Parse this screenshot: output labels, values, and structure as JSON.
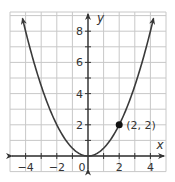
{
  "chart_data": {
    "type": "line",
    "title": "",
    "function": "y = x^2 / 2",
    "xlabel": "x",
    "ylabel": "y",
    "xlim": [
      -5,
      5
    ],
    "ylim": [
      -1,
      9
    ],
    "grid": true,
    "x_ticks": [
      -4,
      -2,
      0,
      2,
      4
    ],
    "x_tick_labels": [
      "−4",
      "−2",
      "0",
      "2",
      "4"
    ],
    "y_ticks": [
      2,
      4,
      6,
      8
    ],
    "y_tick_labels": [
      "2",
      "4",
      "6",
      "8"
    ],
    "series": [
      {
        "name": "parabola",
        "x": [
          -4.2,
          -4,
          -3,
          -2,
          -1,
          0,
          1,
          2,
          3,
          4,
          4.2
        ],
        "values": [
          8.82,
          8,
          4.5,
          2,
          0.5,
          0,
          0.5,
          2,
          4.5,
          8,
          8.82
        ]
      }
    ],
    "annotations": [
      {
        "x": 2,
        "y": 2,
        "label": "(2, 2)",
        "marker": "filled-circle"
      }
    ]
  },
  "style": {
    "curve_color": "#3a3a3a",
    "grid_color": "#c8c8c8",
    "axis_color": "#333333",
    "text_color": "#333333"
  }
}
